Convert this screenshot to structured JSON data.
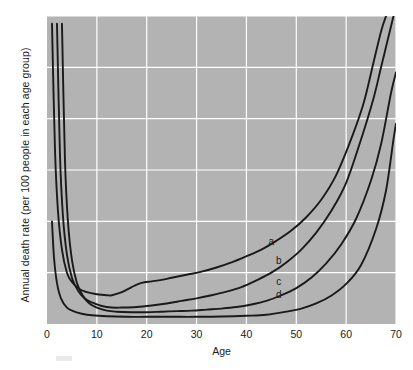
{
  "chart_data": {
    "type": "line",
    "title": "",
    "xlabel": "Age",
    "ylabel": "Annual death rate (per 100 people in each age group)",
    "xlim": [
      0,
      70
    ],
    "ylim": [
      0,
      6
    ],
    "xticks": [
      0,
      10,
      20,
      30,
      40,
      50,
      60,
      70
    ],
    "yticks": [
      0,
      1,
      2,
      3,
      4,
      5,
      6
    ],
    "grid": true,
    "legend_position": "inline-curve-labels",
    "plot_background": "#b3b3b3",
    "gridline_color": "#ffffff",
    "line_color": "#1a1a1a",
    "annotations": [
      {
        "label": "a",
        "x": 45.0,
        "y": 1.62
      },
      {
        "label": "b",
        "x": 46.5,
        "y": 1.25
      },
      {
        "label": "c",
        "x": 46.5,
        "y": 0.83
      },
      {
        "label": "d",
        "x": 46.5,
        "y": 0.58
      }
    ],
    "series": [
      {
        "name": "a",
        "x": [
          1.0,
          1.6,
          2.2,
          3.0,
          4.0,
          5.0,
          6.5,
          8.0,
          10.0,
          12.0,
          13.0,
          15.0,
          17.0,
          19.0,
          21.0,
          23.0,
          25.0,
          28.0,
          31.0,
          34.0,
          37.0,
          40.0,
          43.0,
          46.0,
          49.0,
          52.0,
          55.0,
          58.0,
          61.0,
          63.5,
          65.5,
          67.0,
          68.0
        ],
        "y": [
          5.85,
          3.4,
          2.2,
          1.45,
          1.0,
          0.82,
          0.68,
          0.62,
          0.58,
          0.56,
          0.56,
          0.62,
          0.72,
          0.8,
          0.83,
          0.86,
          0.9,
          0.96,
          1.02,
          1.1,
          1.2,
          1.32,
          1.45,
          1.62,
          1.82,
          2.08,
          2.42,
          2.9,
          3.6,
          4.3,
          5.1,
          5.7,
          6.0
        ]
      },
      {
        "name": "b",
        "x": [
          2.0,
          2.6,
          3.2,
          4.0,
          5.0,
          6.2,
          7.5,
          9.0,
          11.0,
          13.0,
          15.0,
          18.0,
          21.0,
          24.0,
          27.0,
          30.0,
          33.0,
          36.0,
          39.0,
          42.0,
          45.0,
          48.0,
          51.0,
          54.0,
          57.0,
          60.0,
          63.0,
          65.5,
          67.0,
          68.5,
          69.5
        ],
        "y": [
          5.85,
          3.3,
          2.1,
          1.35,
          0.9,
          0.65,
          0.5,
          0.42,
          0.35,
          0.32,
          0.32,
          0.33,
          0.36,
          0.4,
          0.45,
          0.5,
          0.56,
          0.63,
          0.72,
          0.85,
          1.0,
          1.2,
          1.45,
          1.78,
          2.2,
          2.75,
          3.6,
          4.4,
          5.0,
          5.6,
          6.0
        ]
      },
      {
        "name": "c",
        "x": [
          3.0,
          3.6,
          4.2,
          5.0,
          6.0,
          7.2,
          8.5,
          10.0,
          12.0,
          14.0,
          17.0,
          20.0,
          23.0,
          26.0,
          29.0,
          32.0,
          35.0,
          38.0,
          41.0,
          44.0,
          47.0,
          50.0,
          53.0,
          56.0,
          59.0,
          62.0,
          65.0,
          67.0,
          69.0,
          70.0
        ],
        "y": [
          5.85,
          3.2,
          2.0,
          1.25,
          0.8,
          0.55,
          0.4,
          0.32,
          0.26,
          0.24,
          0.23,
          0.23,
          0.24,
          0.25,
          0.26,
          0.28,
          0.3,
          0.33,
          0.38,
          0.45,
          0.56,
          0.7,
          0.9,
          1.18,
          1.55,
          2.05,
          2.8,
          3.5,
          4.5,
          4.9
        ]
      },
      {
        "name": "d",
        "x": [
          1.0,
          1.4,
          2.0,
          2.8,
          4.0,
          5.5,
          7.0,
          9.0,
          12.0,
          16.0,
          20.0,
          25.0,
          30.0,
          35.0,
          40.0,
          44.0,
          48.0,
          51.0,
          54.0,
          57.0,
          60.0,
          63.0,
          66.0,
          68.0,
          69.5,
          70.0
        ],
        "y": [
          2.0,
          1.3,
          0.8,
          0.5,
          0.32,
          0.24,
          0.2,
          0.17,
          0.15,
          0.14,
          0.14,
          0.14,
          0.14,
          0.145,
          0.16,
          0.18,
          0.24,
          0.3,
          0.4,
          0.55,
          0.78,
          1.15,
          1.85,
          2.6,
          3.6,
          3.9
        ]
      }
    ]
  },
  "axes": {
    "ylabel": "Annual death rate (per 100 people in each age group)",
    "xlabel": "Age",
    "yticks": [
      "0",
      "1",
      "2",
      "3",
      "4",
      "5",
      "6"
    ],
    "xticks": [
      "0",
      "10",
      "20",
      "30",
      "40",
      "50",
      "60",
      "70"
    ]
  },
  "curve_labels": [
    "a",
    "b",
    "c",
    "d"
  ]
}
